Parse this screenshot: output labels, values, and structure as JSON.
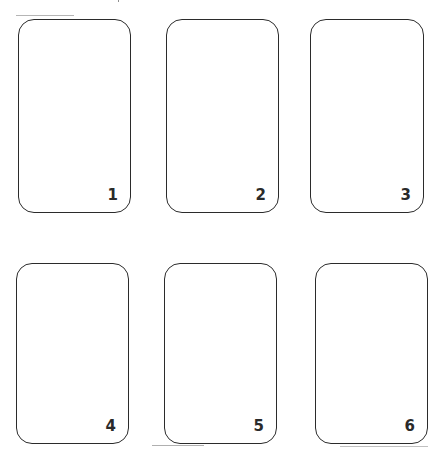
{
  "cards": [
    {
      "number": "1"
    },
    {
      "number": "2"
    },
    {
      "number": "3"
    },
    {
      "number": "4"
    },
    {
      "number": "5"
    },
    {
      "number": "6"
    }
  ],
  "colors": {
    "background": "#ffffff",
    "card_border": "#2b2b2b",
    "number_text": "#2a2a2a"
  }
}
